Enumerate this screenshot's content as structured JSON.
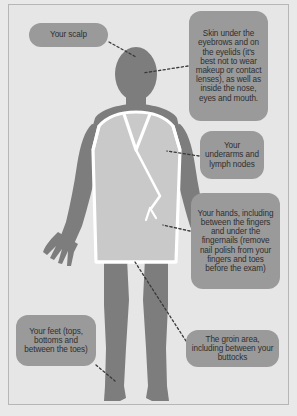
{
  "diagram": {
    "background_color": "#e6e6e6",
    "bubble_color": "#9a9a9a",
    "skin_color": "#7d7d7d",
    "gown_color": "#c9c9c9",
    "gown_outline_color": "#ffffff",
    "leader_line_color": "#3a3a3a",
    "frame_border_color": "#b6b6b6"
  },
  "figure": {
    "name": "human-figure-in-gown"
  },
  "callouts": [
    {
      "id": "scalp",
      "label": "Your scalp",
      "target": "head-top"
    },
    {
      "id": "eyelids",
      "label": "Skin under the eyebrows and on the eyelids (it's best not to wear makeup or contact lenses), as well as inside the nose, eyes and mouth.",
      "target": "face"
    },
    {
      "id": "underarms",
      "label": "Your underarms and lymph nodes",
      "target": "underarm"
    },
    {
      "id": "hands",
      "label": "Your hands, including between the fingers and under the fingernails (remove nail polish from your fingers and toes before the exam)",
      "target": "right-hand"
    },
    {
      "id": "feet",
      "label": "Your feet (tops, bottoms and between the toes)",
      "target": "left-foot"
    },
    {
      "id": "groin",
      "label": "The groin area, including between your buttocks",
      "target": "groin"
    }
  ],
  "leader_lines": [
    {
      "id": "scalp-line",
      "x1": 109,
      "y1": 42,
      "x2": 136,
      "y2": 57
    },
    {
      "id": "eyelids-line",
      "x1": 188,
      "y1": 66,
      "x2": 143,
      "y2": 73
    },
    {
      "id": "underarms-line",
      "x1": 199,
      "y1": 156,
      "x2": 167,
      "y2": 151
    },
    {
      "id": "hands-line",
      "x1": 190,
      "y1": 231,
      "x2": 163,
      "y2": 225
    },
    {
      "id": "feet-line",
      "x1": 96,
      "y1": 365,
      "x2": 115,
      "y2": 381
    },
    {
      "id": "groin-line",
      "x1": 186,
      "y1": 341,
      "x2": 135,
      "y2": 262
    }
  ]
}
